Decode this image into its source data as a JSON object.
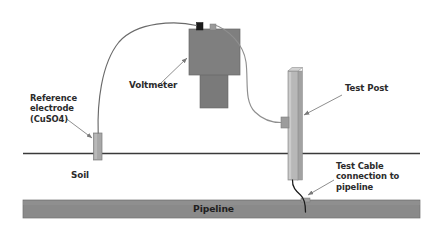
{
  "diagram": {
    "labels": {
      "reference_electrode": "Reference\nelectrode\n(CuSO4)",
      "voltmeter": "Voltmeter",
      "test_post": "Test Post",
      "soil": "Soil",
      "test_cable": "Test Cable\nconnection to\npipeline",
      "pipeline": "Pipeline"
    },
    "colors": {
      "voltmeter_body": "#7f7f7f",
      "voltmeter_body_dark": "#6e6e6e",
      "voltmeter_terminal_dark": "#1c1c1c",
      "voltmeter_terminal_light": "#9a9a9a",
      "pipeline_fill": "#8a8a8a",
      "pipeline_stroke": "#6f6f6f",
      "test_post_fill": "#b8b8b8",
      "test_post_highlight": "#cfcfcf",
      "test_post_shadow": "#8e8e8e",
      "electrode_fill": "#a8a8a8",
      "connector_fill": "#9c9c9c",
      "ground_line": "#3a3a3a",
      "wire": "#6a6a6a",
      "test_cable": "#1a1a1a",
      "leader_line": "#7a7a7a",
      "text": "#2b2b2b",
      "background": "#ffffff"
    },
    "geometry": {
      "ground_line_y": 153,
      "ground_line_x1": 23,
      "ground_line_x2": 420,
      "pipeline_top": 200,
      "pipeline_bottom": 218,
      "electrode_x": 97,
      "test_post_x": 295,
      "cable_pipeline_contact_x": 305
    }
  }
}
